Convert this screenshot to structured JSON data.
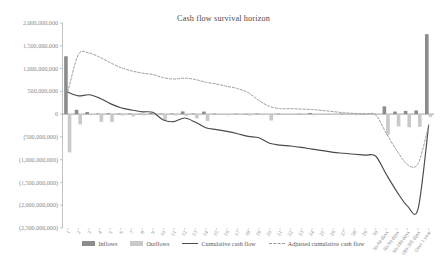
{
  "chart_data": {
    "type": "bar",
    "title": "Cash flow survival horizon",
    "xlabel": "",
    "ylabel": "",
    "ylim": [
      -2500000000,
      2000000000
    ],
    "ytick_values": [
      2000000000,
      1500000000,
      1000000000,
      500000000,
      0,
      -500000000,
      -1000000000,
      -1500000000,
      -2000000000,
      -2500000000
    ],
    "ytick_labels": [
      "2,000,000,000",
      "1,500,000,000",
      "1,000,000,000",
      "500,000,000",
      "0",
      "(500,000,000)",
      "(1,000,000,000)",
      "(1,500,000,000)",
      "(2,000,000,000)",
      "(2,500,000,000)"
    ],
    "grid": false,
    "legend_position": "bottom",
    "categories": [
      "1",
      "2",
      "3",
      "4",
      "5",
      "6",
      "7",
      "8",
      "9",
      "10",
      "11",
      "12",
      "13",
      "14",
      "15",
      "16",
      "17",
      "18",
      "19",
      "20",
      "21",
      "22",
      "23",
      "24",
      "25",
      "26",
      "27",
      "28",
      "29",
      "30",
      "30-60 days",
      "60-90 days",
      "90-180 days",
      "180-365 days",
      "Over 1 year"
    ],
    "series": [
      {
        "name": "Inflows",
        "type": "bar",
        "color": "#8c8c8c",
        "values": [
          1270000000,
          95000000,
          45000000,
          12000000,
          18000000,
          10000000,
          14000000,
          8000000,
          22000000,
          9000000,
          11000000,
          60000000,
          13000000,
          55000000,
          10000000,
          7000000,
          9000000,
          8000000,
          12000000,
          7000000,
          9000000,
          6000000,
          8000000,
          25000000,
          7000000,
          6000000,
          9000000,
          7000000,
          8000000,
          6000000,
          170000000,
          55000000,
          70000000,
          80000000,
          1755000000
        ]
      },
      {
        "name": "Outflows",
        "type": "bar",
        "color": "#c9c9c9",
        "values": [
          -840000000,
          -225000000,
          -20000000,
          -170000000,
          -175000000,
          -30000000,
          -50000000,
          -30000000,
          -25000000,
          -130000000,
          -30000000,
          -40000000,
          -95000000,
          -150000000,
          -20000000,
          -25000000,
          -20000000,
          -30000000,
          -20000000,
          -140000000,
          -20000000,
          -15000000,
          -20000000,
          -25000000,
          -15000000,
          -20000000,
          -15000000,
          -25000000,
          -20000000,
          -20000000,
          -450000000,
          -270000000,
          -290000000,
          -280000000,
          -60000000
        ]
      },
      {
        "name": "Cumulative cash flow",
        "type": "line",
        "style": "solid",
        "color": "#4a4a4a",
        "values": [
          480000000,
          400000000,
          425000000,
          350000000,
          230000000,
          140000000,
          90000000,
          50000000,
          40000000,
          -130000000,
          -165000000,
          -85000000,
          -175000000,
          -300000000,
          -340000000,
          -380000000,
          -430000000,
          -490000000,
          -520000000,
          -640000000,
          -680000000,
          -700000000,
          -730000000,
          -770000000,
          -800000000,
          -840000000,
          -860000000,
          -880000000,
          -900000000,
          -920000000,
          -1320000000,
          -1700000000,
          -2020000000,
          -2080000000,
          -240000000
        ]
      },
      {
        "name": "Adjusted cumulative cash flow",
        "type": "line",
        "style": "dashed",
        "color": "#9a9a9a",
        "values": [
          490000000,
          1310000000,
          1340000000,
          1250000000,
          1130000000,
          1020000000,
          950000000,
          900000000,
          870000000,
          800000000,
          770000000,
          790000000,
          760000000,
          700000000,
          660000000,
          610000000,
          560000000,
          470000000,
          300000000,
          170000000,
          120000000,
          120000000,
          110000000,
          100000000,
          80000000,
          55000000,
          30000000,
          15000000,
          0,
          -15000000,
          -420000000,
          -800000000,
          -1110000000,
          -1090000000,
          -250000000
        ]
      }
    ]
  },
  "legend": {
    "items": [
      {
        "label": "Inflows",
        "kind": "bar",
        "color": "#8c8c8c"
      },
      {
        "label": "Outflows",
        "kind": "bar",
        "color": "#c9c9c9"
      },
      {
        "label": "Cumulative cash flow",
        "kind": "line",
        "color": "#4a4a4a"
      },
      {
        "label": "Adjusted cumulative cash flow",
        "kind": "dash",
        "color": "#9a9a9a"
      }
    ]
  },
  "axis": {
    "axis_color": "#a8a8a8",
    "zero_line_color": "#8a8a8a"
  }
}
